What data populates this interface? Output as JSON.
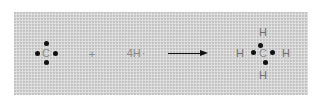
{
  "diagram": {
    "type": "lewis-dot-reaction",
    "reactant1": {
      "atom": "C",
      "valence_electrons": 4
    },
    "plus": "+",
    "reactant2": {
      "label": "4H",
      "radical_dot": "·"
    },
    "product": {
      "center": "C",
      "bonded": {
        "top": "H",
        "bottom": "H",
        "left": "H",
        "right": "H"
      },
      "shared_pairs": 4
    },
    "colors": {
      "panel": "#d6d6d6",
      "text": "#8a8a8a",
      "dots": "#111111",
      "arrow": "#111111"
    }
  }
}
